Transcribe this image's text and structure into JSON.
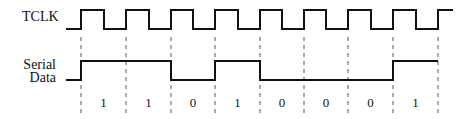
{
  "signals": {
    "clock": {
      "label": "TCLK"
    },
    "data": {
      "label_line1": "Serial",
      "label_line2": "Data"
    }
  },
  "timing": {
    "rising_edges_x": [
      81,
      126,
      171,
      215,
      260,
      304,
      348,
      393,
      438
    ],
    "clock_high_y": 10,
    "clock_low_y": 29,
    "clock_start_x": 66,
    "clock_end_x": 453,
    "data_high_y": 61,
    "data_low_y": 80,
    "data_start_x": 66,
    "dash_top_y": 37,
    "dash_bottom_y": 116
  },
  "bits": [
    "1",
    "1",
    "0",
    "1",
    "0",
    "0",
    "0",
    "1"
  ],
  "colors": {
    "line": "#111111",
    "dash": "#555555"
  }
}
